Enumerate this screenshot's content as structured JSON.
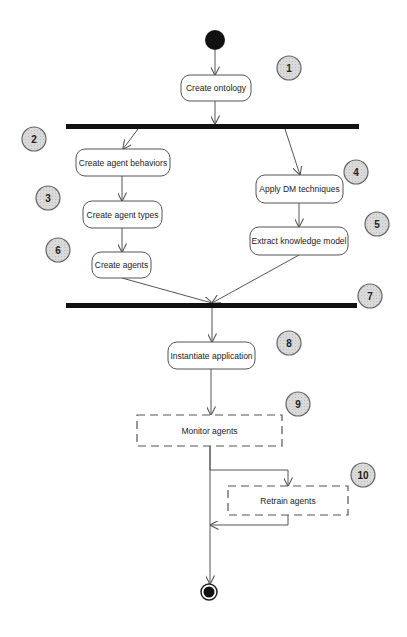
{
  "diagram": {
    "type": "UML activity diagram",
    "start_node": {
      "cx": 215,
      "cy": 40,
      "r": 10
    },
    "end_node": {
      "cx": 209,
      "cy": 592,
      "r": 8
    },
    "activities": [
      {
        "id": "create-ontology",
        "label": "Create ontology",
        "x": 181,
        "y": 75,
        "w": 70,
        "h": 26,
        "style": "solid"
      },
      {
        "id": "create-agent-behaviors",
        "label": "Create agent behaviors",
        "x": 76,
        "y": 149,
        "w": 94,
        "h": 27,
        "style": "solid"
      },
      {
        "id": "create-agent-types",
        "label": "Create agent types",
        "x": 83,
        "y": 201,
        "w": 79,
        "h": 27,
        "style": "solid"
      },
      {
        "id": "create-agents",
        "label": "Create agents",
        "x": 92,
        "y": 252,
        "w": 59,
        "h": 26,
        "style": "solid"
      },
      {
        "id": "apply-dm-techniques",
        "label": "Apply DM techniques",
        "x": 256,
        "y": 175,
        "w": 87,
        "h": 28,
        "style": "solid"
      },
      {
        "id": "extract-knowledge-model",
        "label": "Extract knowledge model",
        "x": 250,
        "y": 227,
        "w": 98,
        "h": 28,
        "style": "solid"
      },
      {
        "id": "instantiate-application",
        "label": "Instantiate application",
        "x": 168,
        "y": 342,
        "w": 87,
        "h": 27,
        "style": "solid"
      },
      {
        "id": "monitor-agents",
        "label": "Monitor agents",
        "x": 137,
        "y": 415,
        "w": 145,
        "h": 31,
        "style": "dashed"
      },
      {
        "id": "retrain-agents",
        "label": "Retrain agents",
        "x": 228,
        "y": 486,
        "w": 120,
        "h": 29,
        "style": "dashed"
      }
    ],
    "sync_bars": [
      {
        "id": "fork-bar",
        "x": 66,
        "y": 124,
        "w": 293,
        "h": 5
      },
      {
        "id": "join-bar",
        "x": 66,
        "y": 303,
        "w": 291,
        "h": 5
      }
    ],
    "step_markers": [
      {
        "label": "1",
        "cx": 289,
        "cy": 68
      },
      {
        "label": "2",
        "cx": 34,
        "cy": 139
      },
      {
        "label": "3",
        "cx": 48,
        "cy": 198
      },
      {
        "label": "4",
        "cx": 356,
        "cy": 172
      },
      {
        "label": "5",
        "cx": 377,
        "cy": 224
      },
      {
        "label": "6",
        "cx": 58,
        "cy": 250
      },
      {
        "label": "7",
        "cx": 370,
        "cy": 296
      },
      {
        "label": "8",
        "cx": 289,
        "cy": 343
      },
      {
        "label": "9",
        "cx": 298,
        "cy": 404
      },
      {
        "label": "10",
        "cx": 363,
        "cy": 475
      }
    ],
    "edges": [
      {
        "from": "start",
        "to": "create-ontology",
        "points": [
          [
            215,
            50
          ],
          [
            215,
            75
          ]
        ]
      },
      {
        "from": "create-ontology",
        "to": "fork-bar",
        "points": [
          [
            215,
            101
          ],
          [
            215,
            124
          ]
        ]
      },
      {
        "from": "fork-bar",
        "to": "create-agent-behaviors",
        "points": [
          [
            138,
            129
          ],
          [
            123,
            149
          ]
        ]
      },
      {
        "from": "fork-bar",
        "to": "apply-dm-techniques",
        "points": [
          [
            285,
            129
          ],
          [
            300,
            175
          ]
        ]
      },
      {
        "from": "create-agent-behaviors",
        "to": "create-agent-types",
        "points": [
          [
            122,
            176
          ],
          [
            122,
            201
          ]
        ]
      },
      {
        "from": "create-agent-types",
        "to": "create-agents",
        "points": [
          [
            122,
            228
          ],
          [
            122,
            252
          ]
        ]
      },
      {
        "from": "apply-dm-techniques",
        "to": "extract-knowledge-model",
        "points": [
          [
            299,
            203
          ],
          [
            299,
            227
          ]
        ]
      },
      {
        "from": "create-agents",
        "to": "join-bar",
        "points": [
          [
            122,
            278
          ],
          [
            212,
            303
          ]
        ]
      },
      {
        "from": "extract-knowledge-model",
        "to": "join-bar",
        "points": [
          [
            299,
            255
          ],
          [
            212,
            303
          ]
        ]
      },
      {
        "from": "join-bar",
        "to": "instantiate-application",
        "points": [
          [
            212,
            308
          ],
          [
            212,
            342
          ]
        ]
      },
      {
        "from": "instantiate-application",
        "to": "monitor-agents",
        "points": [
          [
            211,
            369
          ],
          [
            211,
            415
          ]
        ]
      },
      {
        "from": "monitor-agents",
        "to": "retrain-agents",
        "points": [
          [
            210,
            446
          ],
          [
            210,
            470
          ],
          [
            288,
            470
          ],
          [
            288,
            486
          ]
        ]
      },
      {
        "from": "retrain-agents",
        "to": "flow-line",
        "points": [
          [
            288,
            515
          ],
          [
            288,
            525
          ],
          [
            210,
            525
          ]
        ]
      },
      {
        "from": "monitor-agents",
        "to": "end",
        "points": [
          [
            210,
            446
          ],
          [
            210,
            584
          ]
        ]
      }
    ]
  },
  "colors": {
    "background": "#ffffff",
    "stroke": "#555555",
    "bar": "#111111",
    "node_fill": "#ffffff",
    "marker_fill": "#d6d6d6",
    "marker_stroke": "#666666",
    "text": "#222222"
  }
}
